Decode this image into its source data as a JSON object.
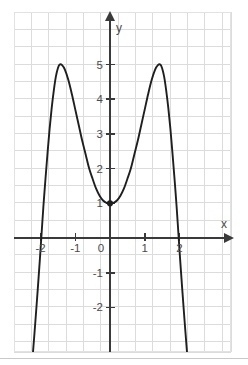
{
  "figure": {
    "kind": "cartesian-plot",
    "background_color": "#ffffff",
    "grid_color": "#dcdcdc",
    "axis_color": "#3a3a3a",
    "curve_color": "#1f1f1f",
    "plot_area": {
      "x": 14,
      "y": 12,
      "width": 217,
      "height": 340
    },
    "origin_px": {
      "x": 110,
      "y": 238
    },
    "unit_px": {
      "x": 34.7,
      "y": 34.7
    },
    "grid_step_px": 17.35
  },
  "axes": {
    "x_axis_label": "x",
    "y_axis_label": "y",
    "x_ticks": [
      {
        "value": -2,
        "label": "-2"
      },
      {
        "value": -1,
        "label": "-1"
      },
      {
        "value": 0,
        "label": "0"
      },
      {
        "value": 1,
        "label": "1"
      },
      {
        "value": 2,
        "label": "2"
      }
    ],
    "y_ticks": [
      {
        "value": 5,
        "label": "5"
      },
      {
        "value": 4,
        "label": "4"
      },
      {
        "value": 3,
        "label": "3"
      },
      {
        "value": 2,
        "label": "2"
      },
      {
        "value": 1,
        "label": "1"
      },
      {
        "value": -1,
        "label": "-1"
      },
      {
        "value": -2,
        "label": "-2"
      }
    ],
    "x_range": [
      -2.77,
      3.49
    ],
    "y_range": [
      -3.29,
      6.51
    ],
    "grid": true
  },
  "chart_data": {
    "type": "line",
    "title": "",
    "xlabel": "x",
    "ylabel": "y",
    "xlim": [
      -2.77,
      3.49
    ],
    "ylim": [
      -3.29,
      6.51
    ],
    "grid": true,
    "legend": "none",
    "series": [
      {
        "name": "curve",
        "description": "quartic with two maxima and a local minimum at the y-intercept",
        "x": [
          -2.22,
          -2.15,
          -2.08,
          -2.02,
          -1.97,
          -1.92,
          -1.86,
          -1.8,
          -1.74,
          -1.68,
          -1.62,
          -1.56,
          -1.5,
          -1.45,
          -1.38,
          -1.3,
          -1.2,
          -1.1,
          -1.0,
          -0.9,
          -0.8,
          -0.7,
          -0.6,
          -0.5,
          -0.4,
          -0.3,
          -0.2,
          -0.1,
          0.0,
          0.1,
          0.2,
          0.3,
          0.4,
          0.5,
          0.6,
          0.7,
          0.8,
          0.9,
          1.0,
          1.1,
          1.2,
          1.3,
          1.38,
          1.45,
          1.5,
          1.56,
          1.62,
          1.68,
          1.74,
          1.8,
          1.86,
          1.92,
          1.97,
          2.02,
          2.08,
          2.15,
          2.22
        ],
        "y": [
          -3.3,
          -2.4,
          -1.45,
          -0.6,
          0.15,
          0.9,
          1.7,
          2.45,
          3.15,
          3.75,
          4.25,
          4.65,
          4.9,
          5.0,
          4.98,
          4.85,
          4.55,
          4.15,
          3.7,
          3.25,
          2.8,
          2.4,
          2.0,
          1.7,
          1.42,
          1.22,
          1.08,
          1.01,
          1.0,
          1.01,
          1.08,
          1.22,
          1.42,
          1.7,
          2.0,
          2.4,
          2.8,
          3.25,
          3.7,
          4.15,
          4.55,
          4.85,
          4.98,
          5.0,
          4.9,
          4.65,
          4.25,
          3.75,
          3.15,
          2.45,
          1.7,
          0.9,
          0.15,
          -0.6,
          -1.45,
          -2.4,
          -3.3
        ]
      }
    ],
    "annotations": [
      {
        "name": "y-intercept-minimum",
        "x": 0,
        "y": 1,
        "marker": "filled-dot"
      }
    ],
    "key_features": {
      "local_minimum": {
        "x": 0,
        "y": 1
      },
      "maxima": [
        {
          "x": -1.45,
          "y": 5
        },
        {
          "x": 1.45,
          "y": 5
        }
      ],
      "x_intercepts": [
        -2,
        2
      ],
      "y_intercept": 1
    }
  }
}
